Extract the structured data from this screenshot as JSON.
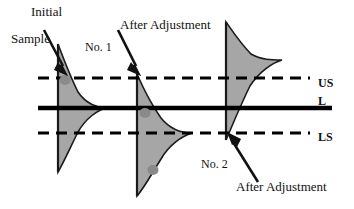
{
  "figure": {
    "type": "statistical-process-diagram",
    "width": 354,
    "height": 209,
    "background_color": "#ffffff",
    "annotations": {
      "initial": "Initial",
      "sample": "Sample",
      "after_adjustment_top": "After Adjustment",
      "no_1": "No. 1",
      "no_2": "No. 2",
      "after_adjustment_bottom": "After Adjustment"
    },
    "limit_labels": {
      "upper": "US",
      "center": "L",
      "lower": "LS"
    },
    "colors": {
      "distribution_fill": "#a6a6a6",
      "distribution_stroke": "#1a1a1a",
      "line": "#000000",
      "sample_dot": "#8a8a8a",
      "text": "#111111"
    },
    "lines": [
      {
        "name": "upper-spec-line",
        "label": "US",
        "style": "dashed",
        "y": 78,
        "x_start": 38,
        "x_end": 310
      },
      {
        "name": "center-line",
        "label": "L",
        "style": "solid",
        "y": 108,
        "x_start": 38,
        "x_end": 332
      },
      {
        "name": "lower-spec-line",
        "label": "LS",
        "style": "dashed",
        "y": 133,
        "x_start": 38,
        "x_end": 310
      }
    ],
    "distributions": [
      {
        "name": "distribution-initial",
        "axis_x": 58,
        "peak_y": 108,
        "top_y": 44,
        "bottom_y": 172,
        "max_width": 48,
        "description": "initial sample distribution centered on center line L"
      },
      {
        "name": "distribution-no-1",
        "axis_x": 137,
        "peak_y": 133,
        "top_y": 74,
        "bottom_y": 196,
        "max_width": 55,
        "description": "distribution after adjustment No. 1, centered on lower spec line LS"
      },
      {
        "name": "distribution-no-2",
        "axis_x": 226,
        "peak_y": 60,
        "top_y": 22,
        "bottom_y": 140,
        "max_width": 56,
        "description": "distribution after adjustment No. 2, peak above upper spec line US"
      }
    ],
    "sample_dots": [
      {
        "name": "sample-dot-initial",
        "cx": 65,
        "cy": 80,
        "r": 5
      },
      {
        "name": "sample-dot-no-1",
        "cx": 145,
        "cy": 113,
        "r": 5
      },
      {
        "name": "sample-dot-no-2",
        "cx": 153,
        "cy": 170,
        "r": 5
      }
    ],
    "arrows": [
      {
        "name": "arrow-initial-sample",
        "from": [
          46,
          37
        ],
        "to": [
          68,
          72
        ]
      },
      {
        "name": "arrow-after-adjustment-top",
        "from": [
          119,
          37
        ],
        "to": [
          140,
          72
        ]
      },
      {
        "name": "arrow-after-adjustment-bottom",
        "from": [
          258,
          183
        ],
        "to": [
          229,
          136
        ]
      }
    ]
  }
}
